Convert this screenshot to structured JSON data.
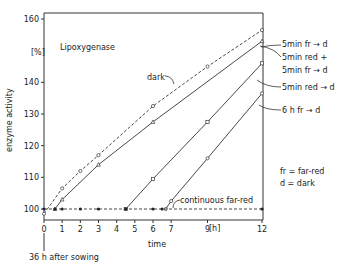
{
  "chart_data": {
    "type": "line",
    "title": "Lipoxygenase",
    "xlabel": "time",
    "x_unit": "[h]",
    "ylabel": "enzyme activity",
    "y_unit": "[%]",
    "xlim": [
      0,
      12
    ],
    "ylim": [
      97,
      161
    ],
    "x_ticks": [
      0,
      1,
      2,
      3,
      4,
      5,
      6,
      7,
      9,
      12
    ],
    "y_ticks": [
      100,
      110,
      120,
      130,
      140,
      160
    ],
    "grid": false,
    "x_origin_note": "36 h after sowing",
    "legend_notes": [
      "fr = far-red",
      "d = dark"
    ],
    "series": [
      {
        "name": "dark",
        "style": "dashed",
        "marker": "open-circle",
        "x": [
          0,
          1,
          2,
          3,
          6,
          9,
          12
        ],
        "y": [
          98.5,
          106.5,
          112,
          117,
          132.5,
          145,
          156.5
        ]
      },
      {
        "name": "5 min fr → d",
        "style": "solid",
        "marker": "triangle",
        "x": [
          0.6,
          1,
          3,
          6,
          12
        ],
        "y": [
          100,
          103,
          114,
          127.5,
          153
        ]
      },
      {
        "name": "5 min red + 5 min fr → d",
        "style": "solid",
        "marker": "open-square",
        "x": [
          4.5,
          6,
          9,
          12
        ],
        "y": [
          100,
          109.5,
          127.5,
          146
        ]
      },
      {
        "name": "5 min red → d",
        "style": "solid",
        "marker": "open-square",
        "x": [
          4.5,
          6,
          9,
          12
        ],
        "y": [
          100,
          109.5,
          127.5,
          146
        ]
      },
      {
        "name": "6 h fr → d",
        "style": "solid",
        "marker": "open-circle",
        "x": [
          6.7,
          7,
          9,
          12
        ],
        "y": [
          100,
          102.5,
          116,
          136.5
        ]
      },
      {
        "name": "continuous far-red",
        "style": "dashed",
        "marker": "filled-circle",
        "x": [
          0,
          0.6,
          1,
          2,
          3,
          4.5,
          6,
          6.5,
          12
        ],
        "y": [
          100,
          100,
          100,
          100,
          100,
          100,
          100,
          100,
          100
        ]
      }
    ]
  },
  "labels": {
    "title": "Lipoxygenase",
    "y_unit": "[%]",
    "ylabel": "enzyme activity",
    "xlabel": "time",
    "x_unit": "[h]",
    "origin_note": "36 h after sowing",
    "dark": "dark",
    "continuous": "continuous far-red",
    "right": [
      "5min  fr → d",
      "5min  red +",
      "5min  fr → d",
      "5min  red → d",
      "6 h    fr → d"
    ],
    "note_fr": "fr = far-red",
    "note_d": "d  = dark"
  }
}
